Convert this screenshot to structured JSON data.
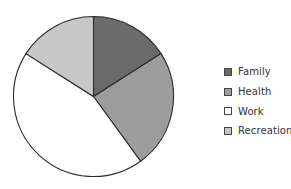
{
  "chart_data": {
    "type": "pie",
    "title": "",
    "categories": [
      "Family",
      "Health",
      "Work",
      "Recreation"
    ],
    "values": [
      16,
      24,
      44,
      16
    ],
    "colors": [
      "#6b6b6b",
      "#9c9c9c",
      "#ffffff",
      "#c8c8c8"
    ],
    "start_angle_deg": 0,
    "direction": "clockwise",
    "legend_position": "right"
  },
  "legend": {
    "items": [
      {
        "label": "Family",
        "color": "#6b6b6b"
      },
      {
        "label": "Health",
        "color": "#9c9c9c"
      },
      {
        "label": "Work",
        "color": "#ffffff"
      },
      {
        "label": "Recreation",
        "color": "#c8c8c8"
      }
    ]
  }
}
